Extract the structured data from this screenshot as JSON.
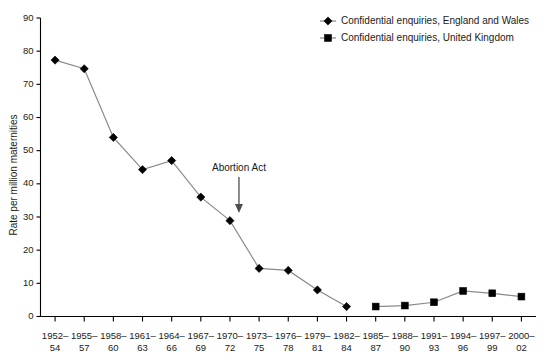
{
  "chart_data": {
    "type": "line",
    "title": "",
    "xlabel": "",
    "ylabel": "Rate per million maternities",
    "ylim": [
      0,
      90
    ],
    "ytick_step": 10,
    "yticks": [
      0,
      10,
      20,
      30,
      40,
      50,
      60,
      70,
      80,
      90
    ],
    "grid": false,
    "legend_position": "top-right",
    "categories": [
      "1952–\n54",
      "1955–\n57",
      "1958–\n60",
      "1961–\n63",
      "1964–\n66",
      "1967–\n69",
      "1970–\n72",
      "1973–\n75",
      "1976–\n78",
      "1979–\n81",
      "1982–\n84",
      "1985–\n87",
      "1988–\n90",
      "1991–\n93",
      "1994–\n96",
      "1997–\n99",
      "2000–\n02"
    ],
    "categories_top": [
      "1952–",
      "1955–",
      "1958–",
      "1961–",
      "1964–",
      "1967–",
      "1970–",
      "1973–",
      "1976–",
      "1979–",
      "1982–",
      "1985–",
      "1988–",
      "1991–",
      "1994–",
      "1997–",
      "2000–"
    ],
    "categories_bottom": [
      "54",
      "57",
      "60",
      "63",
      "66",
      "69",
      "72",
      "75",
      "78",
      "81",
      "84",
      "87",
      "90",
      "93",
      "96",
      "99",
      "02"
    ],
    "series": [
      {
        "name": "Confidential enquiries, England and Wales",
        "marker": "diamond",
        "values": [
          77.3,
          74.7,
          54.0,
          44.3,
          47.0,
          36.0,
          28.9,
          14.5,
          13.9,
          8.0,
          3.0,
          null,
          null,
          null,
          null,
          null,
          null
        ]
      },
      {
        "name": "Confidential enquiries, United Kingdom",
        "marker": "square",
        "values": [
          null,
          null,
          null,
          null,
          null,
          null,
          null,
          null,
          null,
          null,
          null,
          3.0,
          3.3,
          4.3,
          7.7,
          7.0,
          6.0
        ]
      }
    ],
    "annotations": [
      {
        "label": "Abortion Act",
        "category": "1970–\n72",
        "type": "down-arrow"
      }
    ]
  },
  "legend": {
    "items": [
      {
        "label": "Confidential enquiries, England and Wales",
        "marker": "diamond"
      },
      {
        "label": "Confidential enquiries, United Kingdom",
        "marker": "square"
      }
    ]
  },
  "colors": {
    "line": "#8a8a8a",
    "marker": "#000000",
    "axis": "#000000",
    "text": "#1a1a1a",
    "annotation": "#4d4d4d",
    "background": "#ffffff"
  }
}
